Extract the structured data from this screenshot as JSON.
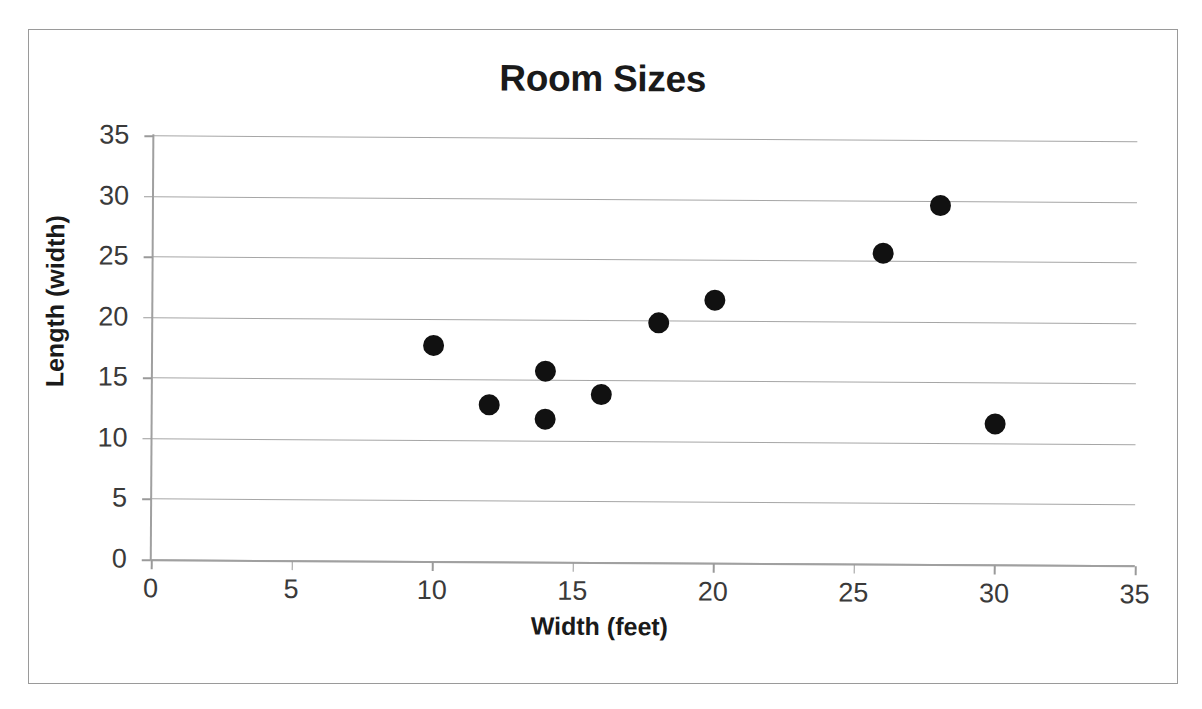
{
  "chart_data": {
    "type": "scatter",
    "title": "Room Sizes",
    "xlabel": "Width (feet)",
    "ylabel": "Length (width)",
    "xlim": [
      0,
      35
    ],
    "ylim": [
      0,
      35
    ],
    "xticks": [
      0,
      5,
      10,
      15,
      20,
      25,
      30,
      35
    ],
    "yticks": [
      0,
      5,
      10,
      15,
      20,
      25,
      30,
      35
    ],
    "grid": "horizontal",
    "legend": "none",
    "marker": {
      "shape": "circle",
      "color": "#111111",
      "size": 21
    },
    "series": [
      {
        "name": "Room Sizes",
        "points": [
          {
            "x": 10,
            "y": 17.8
          },
          {
            "x": 12,
            "y": 12.9
          },
          {
            "x": 14,
            "y": 15.7
          },
          {
            "x": 14,
            "y": 11.8
          },
          {
            "x": 16,
            "y": 13.8
          },
          {
            "x": 18,
            "y": 19.8
          },
          {
            "x": 20,
            "y": 21.7
          },
          {
            "x": 26,
            "y": 25.6
          },
          {
            "x": 28,
            "y": 29.6
          },
          {
            "x": 30,
            "y": 11.6
          }
        ]
      }
    ]
  },
  "colors": {
    "marker": "#111111",
    "gridline": "#a6a6a6",
    "axis": "#a0a0a0",
    "text": "#1a1a1a",
    "tick_text": "#3a3a3a",
    "frame": "#9a9a9a",
    "background": "#ffffff"
  }
}
